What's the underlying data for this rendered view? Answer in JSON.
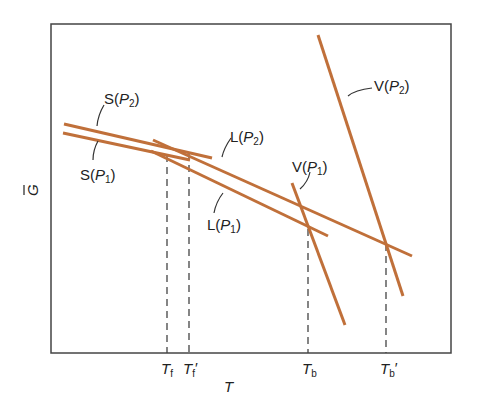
{
  "figure": {
    "type": "Gibbs free energy vs temperature diagram",
    "line_color": "#C0703A",
    "axis_color": "#444444",
    "y_axis": {
      "label": "G",
      "overbar": true
    },
    "x_axis": {
      "label": "T"
    },
    "ticks": [
      {
        "id": "Tf",
        "main": "T",
        "sub": "f",
        "prime": ""
      },
      {
        "id": "Tf_prime",
        "main": "T",
        "sub": "f",
        "prime": "′"
      },
      {
        "id": "Tb",
        "main": "T",
        "sub": "b",
        "prime": ""
      },
      {
        "id": "Tb_prime",
        "main": "T",
        "sub": "b",
        "prime": "′"
      }
    ],
    "lines": [
      {
        "id": "S_P2",
        "phase": "S",
        "pressure": "P",
        "pressure_sub": "2"
      },
      {
        "id": "S_P1",
        "phase": "S",
        "pressure": "P",
        "pressure_sub": "1"
      },
      {
        "id": "L_P2",
        "phase": "L",
        "pressure": "P",
        "pressure_sub": "2"
      },
      {
        "id": "L_P1",
        "phase": "L",
        "pressure": "P",
        "pressure_sub": "1"
      },
      {
        "id": "V_P1",
        "phase": "V",
        "pressure": "P",
        "pressure_sub": "1"
      },
      {
        "id": "V_P2",
        "phase": "V",
        "pressure": "P",
        "pressure_sub": "2"
      }
    ]
  }
}
